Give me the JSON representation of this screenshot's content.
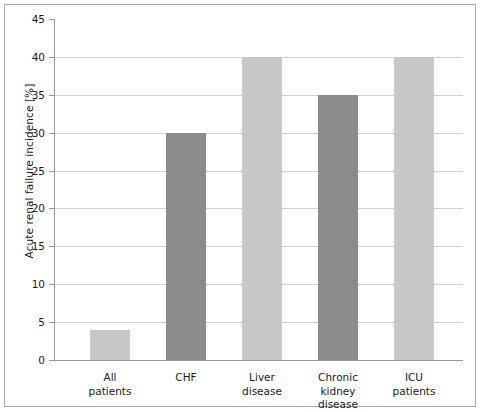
{
  "chart_data": {
    "type": "bar",
    "title": "",
    "subtitle": "",
    "xlabel": "",
    "ylabel": "Acute renal failure incidence [%]",
    "categories": [
      "All\npatients",
      "CHF",
      "Liver\ndisease",
      "Chronic\nkidney\ndisease",
      "ICU\npatients"
    ],
    "values": [
      4,
      30,
      40,
      35,
      40
    ],
    "bar_colors": [
      "#c8c8c8",
      "#8c8c8c",
      "#c8c8c8",
      "#8c8c8c",
      "#c8c8c8"
    ],
    "ylim": [
      0,
      45
    ],
    "ytick_labels": [
      "0",
      "5",
      "10",
      "15",
      "20",
      "25",
      "30",
      "35",
      "40",
      "45"
    ],
    "ytick_values": [
      0,
      5,
      10,
      15,
      20,
      25,
      30,
      35,
      40,
      45
    ],
    "grid": "horizontal",
    "legend": "none",
    "annotations": []
  },
  "colors": {
    "light_bar": "#c8c8c8",
    "dark_bar": "#8c8c8c",
    "gridline": "#cfcfcf",
    "axis": "#9a9a9a",
    "frame": "#a8a8a8",
    "text": "#1a1a1a",
    "background": "#ffffff"
  }
}
